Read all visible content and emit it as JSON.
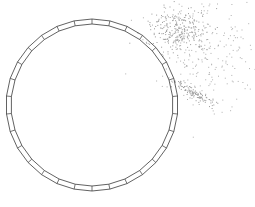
{
  "figure": {
    "width": 255,
    "height": 207,
    "background": "#ffffff",
    "ring": {
      "center": [
        92,
        105
      ],
      "outer_radius": 86,
      "inner_radius": 81,
      "segments": 30,
      "stroke": "#3a3a3a"
    },
    "point_clusters": [
      {
        "name": "upper-right-dense",
        "center": [
          178,
          30
        ],
        "spread": [
          14,
          11
        ],
        "count": 260,
        "color": "#9a9a9a"
      },
      {
        "name": "upper-right-diffuse",
        "center": [
          205,
          45
        ],
        "spread": [
          28,
          28
        ],
        "count": 260,
        "color": "#b0b0b0"
      },
      {
        "name": "lower-streak",
        "center": [
          192,
          92
        ],
        "spread": [
          9,
          5
        ],
        "count": 110,
        "color": "#9a9a9a"
      }
    ]
  }
}
